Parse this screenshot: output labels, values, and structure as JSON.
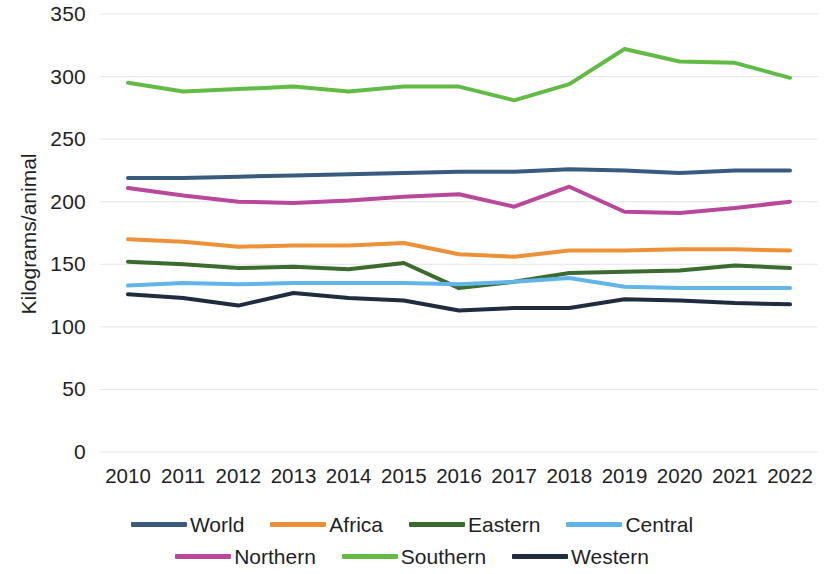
{
  "chart_data": {
    "type": "line",
    "title": "",
    "subtitle": "",
    "xlabel": "",
    "ylabel": "Kilograms/animal",
    "x": [
      2010,
      2011,
      2012,
      2013,
      2014,
      2015,
      2016,
      2017,
      2018,
      2019,
      2020,
      2021,
      2022
    ],
    "x_tick_labels": [
      "2010",
      "2011",
      "2012",
      "2013",
      "2014",
      "2015",
      "2016",
      "2017",
      "2018",
      "2019",
      "2020",
      "2021",
      "2022"
    ],
    "y_tick_labels": [
      "0",
      "50",
      "100",
      "150",
      "200",
      "250",
      "300",
      "350"
    ],
    "y_ticks": [
      0,
      50,
      100,
      150,
      200,
      250,
      300,
      350
    ],
    "ylim": [
      0,
      350
    ],
    "xlim": [
      2010,
      2022
    ],
    "grid": "horizontal",
    "legend_position": "bottom",
    "series": [
      {
        "name": "World",
        "color": "#3b5a7f",
        "values": [
          219,
          219,
          220,
          221,
          222,
          223,
          224,
          224,
          226,
          225,
          223,
          225,
          225
        ]
      },
      {
        "name": "Africa",
        "color": "#ed9138",
        "values": [
          170,
          168,
          164,
          165,
          165,
          167,
          158,
          156,
          161,
          161,
          162,
          162,
          161
        ]
      },
      {
        "name": "Eastern",
        "color": "#3b6b2f",
        "values": [
          152,
          150,
          147,
          148,
          146,
          151,
          131,
          136,
          143,
          144,
          145,
          149,
          147
        ]
      },
      {
        "name": "Central",
        "color": "#62b5e8",
        "values": [
          133,
          135,
          134,
          135,
          135,
          135,
          134,
          136,
          139,
          132,
          131,
          131,
          131
        ]
      },
      {
        "name": "Northern",
        "color": "#b9479a",
        "values": [
          211,
          205,
          200,
          199,
          201,
          204,
          206,
          196,
          212,
          192,
          191,
          195,
          200
        ]
      },
      {
        "name": "Southern",
        "color": "#62bb45",
        "values": [
          295,
          288,
          290,
          292,
          288,
          292,
          292,
          281,
          294,
          322,
          312,
          311,
          299
        ]
      },
      {
        "name": "Western",
        "color": "#202c3f",
        "values": [
          126,
          123,
          117,
          127,
          123,
          121,
          113,
          115,
          115,
          122,
          121,
          119,
          118
        ]
      }
    ]
  },
  "legend": {
    "rows": [
      [
        {
          "label": "World",
          "color": "#3b5a7f"
        },
        {
          "label": "Africa",
          "color": "#ed9138"
        },
        {
          "label": "Eastern",
          "color": "#3b6b2f"
        },
        {
          "label": "Central",
          "color": "#62b5e8"
        }
      ],
      [
        {
          "label": "Northern",
          "color": "#b9479a"
        },
        {
          "label": "Southern",
          "color": "#62bb45"
        },
        {
          "label": "Western",
          "color": "#202c3f"
        }
      ]
    ]
  },
  "axis": {
    "y_title": "Kilograms/animal"
  },
  "style": {
    "gridline_color": "#e6e6e6",
    "text_color": "#1f1f1f",
    "background": "#ffffff",
    "line_width": 4
  }
}
